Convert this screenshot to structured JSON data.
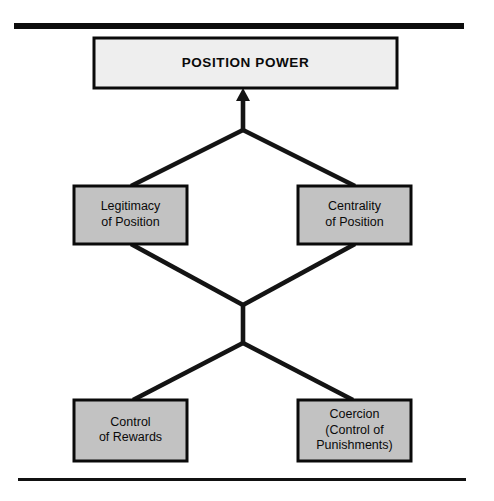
{
  "diagram": {
    "title": "Position Power",
    "type": "hierarchy-flow",
    "rules": {
      "top_rule": {
        "x1": 14,
        "x2": 464,
        "y": 23,
        "thickness": 6,
        "color": "#0d0d0d"
      },
      "bottom_rule": {
        "x1": 18,
        "x2": 466,
        "y": 478,
        "thickness": 3,
        "color": "#111111"
      }
    },
    "colors": {
      "primary_fill": "#eeeeee",
      "secondary_fill": "#c2c2c2",
      "stroke": "#0a0a0a",
      "connector": "#141414",
      "text": "#0a0a0a",
      "background": "#ffffff"
    },
    "nodes": [
      {
        "id": "position-power",
        "level": "top",
        "label": "POSITION POWER",
        "lines": [
          "POSITION POWER"
        ],
        "style": "primary",
        "x": 94,
        "y": 38,
        "width": 303,
        "height": 50
      },
      {
        "id": "legitimacy-of-position",
        "level": "middle",
        "label": "Legitimacy of Position",
        "lines": [
          "Legitimacy",
          "of Position"
        ],
        "style": "secondary",
        "x": 74,
        "y": 186,
        "width": 113,
        "height": 58
      },
      {
        "id": "centrality-of-position",
        "level": "middle",
        "label": "Centrality of Position",
        "lines": [
          "Centrality",
          "of Position"
        ],
        "style": "secondary",
        "x": 298,
        "y": 186,
        "width": 113,
        "height": 58
      },
      {
        "id": "control-of-rewards",
        "level": "bottom",
        "label": "Control of Rewards",
        "lines": [
          "Control",
          "of Rewards"
        ],
        "style": "secondary",
        "x": 74,
        "y": 400,
        "width": 113,
        "height": 61
      },
      {
        "id": "coercion-control-of-punishments",
        "level": "bottom",
        "label": "Coercion (Control of Punishments)",
        "lines": [
          "Coercion",
          "(Control of",
          "Punishments)"
        ],
        "style": "secondary",
        "x": 298,
        "y": 400,
        "width": 113,
        "height": 61
      }
    ],
    "connectors": [
      {
        "id": "arrow-to-position-power",
        "from": "upper-junction",
        "to": "position-power",
        "kind": "arrow",
        "points": "243,130 243,95",
        "arrow_tip": {
          "x": 243,
          "y": 88,
          "half_width": 7,
          "height": 13
        }
      },
      {
        "id": "upper-v-left",
        "from": "legitimacy-of-position",
        "to": "upper-junction",
        "kind": "line",
        "points": "131,186 243,130"
      },
      {
        "id": "upper-v-right",
        "from": "centrality-of-position",
        "to": "upper-junction",
        "kind": "line",
        "points": "355,186 243,130"
      },
      {
        "id": "middle-stem",
        "from": "lower-junction",
        "to": "middle-junction",
        "kind": "line",
        "points": "243,305 243,343"
      },
      {
        "id": "middle-v-left",
        "from": "legitimacy-of-position",
        "to": "middle-junction",
        "kind": "line",
        "points": "131,244 243,305"
      },
      {
        "id": "middle-v-right",
        "from": "centrality-of-position",
        "to": "middle-junction",
        "kind": "line",
        "points": "355,244 243,305"
      },
      {
        "id": "lower-v-left",
        "from": "lower-junction",
        "to": "control-of-rewards",
        "kind": "line",
        "points": "243,343 133,400"
      },
      {
        "id": "lower-v-right",
        "from": "lower-junction",
        "to": "coercion-control-of-punishments",
        "kind": "line",
        "points": "243,343 353,400"
      }
    ]
  }
}
